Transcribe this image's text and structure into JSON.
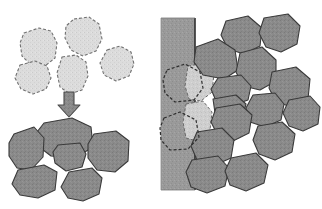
{
  "figure": {
    "title": "Grain rearrangement and wall-adjacent packing schematic",
    "width": 322,
    "height": 209,
    "background_color": "#ffffff"
  },
  "colors": {
    "background": "#ffffff",
    "light_grain_fill": "#dcdcdc",
    "light_grain_stroke": "#707070",
    "dark_grain_fill": "#8a8a8a",
    "dark_grain_stroke": "#3a3a3a",
    "pale_grain_fill": "#cfcfcf",
    "wall_fill": "#9a9a9a",
    "wall_edge": "#2e2e2e",
    "arrow_fill": "#9e9e9e",
    "arrow_stroke": "#4a4a4a",
    "dashed_stroke": "#3a3a3a"
  },
  "strokes": {
    "light_dash_pattern": "3,2",
    "wall_dash_pattern": "3,2",
    "light_stroke_width": 1.1,
    "dark_stroke_width": 1.1,
    "wall_edge_width": 1.6
  },
  "left_panel": {
    "label": "left-panel",
    "before_group": {
      "label": "initial-loose-grain-cluster",
      "style": "light-fill-dashed-outline",
      "grain_count": 5,
      "grains": [
        {
          "id": "light-grain-1",
          "points": "74,19 89,17 99,24 102,39 96,51 83,56 71,50 65,38 66,26"
        },
        {
          "id": "light-grain-2",
          "points": "24,33 39,28 51,31 57,43 55,58 45,66 31,65 22,56 20,43"
        },
        {
          "id": "light-grain-3",
          "points": "107,50 120,46 131,52 134,64 129,76 116,81 104,75 100,63"
        },
        {
          "id": "light-grain-4",
          "points": "20,65 35,61 47,66 51,78 46,89 33,94 21,89 15,78"
        },
        {
          "id": "light-grain-5",
          "points": "62,57 76,55 86,62 88,76 82,90 70,94 60,87 57,73"
        }
      ]
    },
    "arrow": {
      "id": "transformation-arrow",
      "label": "downward-process-arrow",
      "direction": "down",
      "points": "64,92 74,92 74,105 80,105 69,117 58,105 64,105"
    },
    "after_group": {
      "label": "rearranged-dense-grain-cluster",
      "style": "dark-fill-solid-outline",
      "grain_count": 6,
      "grains": [
        {
          "id": "dark-grain-1",
          "points": "44,123 72,118 91,127 93,147 75,158 51,156 38,146 37,132"
        },
        {
          "id": "dark-grain-2",
          "points": "14,134 34,127 44,138 43,157 31,170 17,168 9,156 9,143"
        },
        {
          "id": "dark-grain-3",
          "points": "94,134 116,131 129,141 128,161 115,172 97,170 88,158 88,144"
        },
        {
          "id": "dark-grain-4",
          "points": "58,145 80,143 86,154 82,167 66,171 55,163 53,152"
        },
        {
          "id": "dark-grain-5",
          "points": "18,170 44,165 57,172 55,190 38,198 20,195 12,184"
        },
        {
          "id": "dark-grain-6",
          "points": "69,172 92,168 102,178 99,194 83,201 68,198 61,187"
        }
      ]
    }
  },
  "right_panel": {
    "label": "right-panel",
    "wall": {
      "id": "substrate-wall",
      "label": "vertical-wall-substrate",
      "x": 161,
      "y": 18,
      "width": 34,
      "height": 172,
      "edge_label": "wall-right-edge"
    },
    "ghost_outlines": {
      "label": "original-grain-ghost-outlines",
      "style": "dashed-no-fill",
      "outlines": [
        {
          "id": "ghost-outline-1",
          "points": "167,70 185,64 200,72 203,88 194,100 175,102 165,93 163,80"
        },
        {
          "id": "ghost-outline-2",
          "points": "164,118 180,112 196,120 199,137 188,149 170,150 161,140 160,128"
        }
      ]
    },
    "pale_grains": {
      "label": "wall-adjacent-pale-grains",
      "style": "pale-fill-dashed-outline",
      "grains": [
        {
          "id": "pale-grain-1",
          "points": "188,66 206,63 214,74 212,92 201,101 189,99 185,86"
        },
        {
          "id": "pale-grain-2",
          "points": "186,104 203,101 212,112 210,130 197,141 186,138 183,122"
        }
      ]
    },
    "packed_grains": {
      "label": "packed-dark-grain-assembly",
      "style": "dark-fill-solid-outline",
      "grain_count": 14,
      "grains": [
        {
          "id": "packed-grain-1",
          "points": "196,47 218,39 235,50 238,70 224,79 203,75 194,62"
        },
        {
          "id": "packed-grain-2",
          "points": "240,53 262,47 276,60 276,81 260,90 243,86 236,72"
        },
        {
          "id": "packed-grain-3",
          "points": "218,78 241,75 251,86 248,100 231,106 216,101 211,89"
        },
        {
          "id": "packed-grain-4",
          "points": "272,72 296,67 310,79 308,99 292,107 276,102 269,88"
        },
        {
          "id": "packed-grain-5",
          "points": "253,95 275,93 284,104 281,120 265,127 250,122 246,108"
        },
        {
          "id": "packed-grain-6",
          "points": "216,108 240,104 252,115 249,133 233,141 218,136 211,122"
        },
        {
          "id": "packed-grain-7",
          "points": "213,99 236,95 246,104 243,115 226,120 215,113"
        },
        {
          "id": "packed-grain-8",
          "points": "258,126 282,122 295,134 292,152 275,160 259,154 253,140"
        },
        {
          "id": "packed-grain-9",
          "points": "197,132 222,128 234,140 231,158 213,166 197,160 191,146"
        },
        {
          "id": "packed-grain-10",
          "points": "192,160 218,156 229,168 225,186 207,193 191,187 186,172"
        },
        {
          "id": "packed-grain-11",
          "points": "231,158 256,153 268,165 264,183 246,191 230,185 225,171"
        },
        {
          "id": "packed-grain-12",
          "points": "289,100 310,96 320,107 318,124 303,131 289,126 283,113"
        },
        {
          "id": "packed-grain-13",
          "points": "226,21 248,16 262,28 260,46 244,54 228,49 221,35"
        },
        {
          "id": "packed-grain-14",
          "points": "264,18 288,14 300,26 297,44 281,52 266,47 259,33"
        }
      ]
    }
  }
}
